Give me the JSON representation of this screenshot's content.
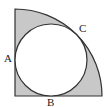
{
  "diagram": {
    "labels": {
      "a": "A",
      "b": "B",
      "c": "C"
    },
    "colors": {
      "shade": "#c8c8c8",
      "stroke": "#333333",
      "circle_fill": "#ffffff"
    }
  }
}
